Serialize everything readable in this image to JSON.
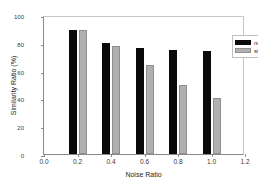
{
  "chart_data": {
    "type": "bar",
    "title": "",
    "subtitle": "",
    "xlabel": "Noise Ratio",
    "ylabel": "Similarity Ratio (%)",
    "xlim": [
      0.0,
      1.2
    ],
    "ylim": [
      0,
      100
    ],
    "x": [
      0.2,
      0.4,
      0.6,
      0.8,
      1.0
    ],
    "categories": [
      "0.2",
      "0.4",
      "0.6",
      "0.8",
      "1.0"
    ],
    "xticks": [
      "0.0",
      "0.2",
      "0.4",
      "0.6",
      "0.8",
      "1.0",
      "1.2"
    ],
    "xtick_values": [
      0.0,
      0.2,
      0.4,
      0.6,
      0.8,
      1.0,
      1.2
    ],
    "yticks": [
      "0",
      "20",
      "40",
      "60",
      "80",
      "100"
    ],
    "ytick_values": [
      0,
      20,
      40,
      60,
      80,
      100
    ],
    "grid": false,
    "legend_position": "upper right",
    "series": [
      {
        "name": "node",
        "color": "#0a0a0a",
        "values": [
          89,
          80,
          76,
          75,
          74
        ]
      },
      {
        "name": "structure",
        "color": "#b0b0b0",
        "values": [
          89,
          78,
          64,
          50,
          40
        ]
      }
    ],
    "annotations": []
  },
  "legend": {
    "items": [
      {
        "label": "node"
      },
      {
        "label": "structure"
      }
    ]
  }
}
